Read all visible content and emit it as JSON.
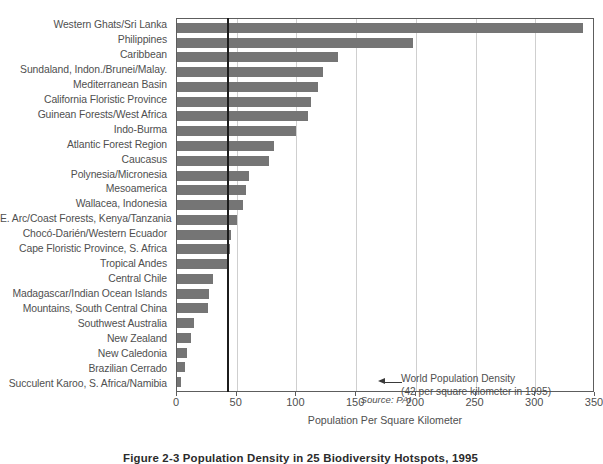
{
  "chart_data": {
    "type": "bar",
    "orientation": "horizontal",
    "title": "Figure 2-3 Population Density in 25 Biodiversity Hotspots, 1995",
    "xlabel": "Population Per Square Kilometer",
    "ylabel": "",
    "xlim": [
      0,
      350
    ],
    "xticks": [
      0,
      50,
      100,
      150,
      200,
      250,
      300,
      350
    ],
    "xticklabels": [
      "0",
      "50",
      "100",
      "150",
      "200",
      "250",
      "300",
      "350"
    ],
    "grid": "vertical",
    "legend": "none",
    "bar_color": "#757575",
    "categories": [
      "Western Ghats/Sri Lanka",
      "Philippines",
      "Caribbean",
      "Sundaland, Indon./Brunei/Malay.",
      "Mediterranean Basin",
      "California Floristic Province",
      "Guinean Forests/West Africa",
      "Indo-Burma",
      "Atlantic Forest Region",
      "Caucasus",
      "Polynesia/Micronesia",
      "Mesoamerica",
      "Wallacea, Indonesia",
      "E. Arc/Coast Forests, Kenya/Tanzania",
      "Chocó-Darién/Western Ecuador",
      "Cape Floristic Province, S. Africa",
      "Tropical Andes",
      "Central Chile",
      "Madagascar/Indian Ocean Islands",
      "Mountains, South Central China",
      "Southwest Australia",
      "New Zealand",
      "New Caledonia",
      "Brazilian Cerrado",
      "Succulent Karoo, S. Africa/Namibia"
    ],
    "values": [
      340,
      198,
      135,
      122,
      118,
      112,
      110,
      100,
      81,
      77,
      60,
      58,
      55,
      50,
      45,
      44,
      42,
      30,
      27,
      26,
      14,
      12,
      8,
      7,
      3
    ],
    "reference_line": {
      "value": 42,
      "label_line1": "World Population Density",
      "label_line2": "(42 per square kilometer in 1995)",
      "color": "#1c1c1c"
    },
    "annotations": [
      {
        "name": "source",
        "text": "Source: PAI"
      }
    ]
  }
}
